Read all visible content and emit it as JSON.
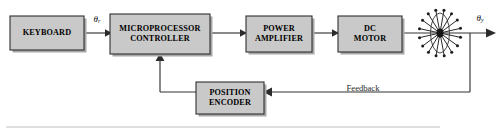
{
  "diagram": {
    "type": "block-diagram",
    "canvas": {
      "width": 504,
      "height": 134
    },
    "colors": {
      "block_fill": "#c9c9c9",
      "block_border": "#2f2f2f",
      "block_shadow": "#a8a8a8",
      "wire": "#333333",
      "background": "#ffffff",
      "rule": "#bfbfbf"
    },
    "blocks": [
      {
        "id": "keyboard",
        "lines": [
          "KEYBOARD"
        ],
        "x": 10,
        "y": 16,
        "w": 74,
        "h": 34
      },
      {
        "id": "microprocessor-controller",
        "lines": [
          "MICROPROCESSOR",
          "CONTROLLER"
        ],
        "x": 110,
        "y": 14,
        "w": 100,
        "h": 40
      },
      {
        "id": "power-amplifier",
        "lines": [
          "POWER",
          "AMPLIFIER"
        ],
        "x": 246,
        "y": 16,
        "w": 66,
        "h": 36
      },
      {
        "id": "dc-motor",
        "lines": [
          "DC",
          "MOTOR"
        ],
        "x": 338,
        "y": 16,
        "w": 64,
        "h": 36
      },
      {
        "id": "position-encoder",
        "lines": [
          "POSITION",
          "ENCODER"
        ],
        "x": 196,
        "y": 82,
        "w": 68,
        "h": 32
      }
    ],
    "signals": {
      "input": {
        "symbol": "θ",
        "subscript": "r",
        "x": 96,
        "y": 20
      },
      "output": {
        "symbol": "θ",
        "subscript": "y",
        "x": 481,
        "y": 20
      }
    },
    "feedback": {
      "label": "Feedback",
      "label_x": 363,
      "label_y": 92
    },
    "load": {
      "id": "radial-load",
      "spokes": 16,
      "center_x": 440,
      "center_y": 33,
      "radius": 22
    }
  }
}
